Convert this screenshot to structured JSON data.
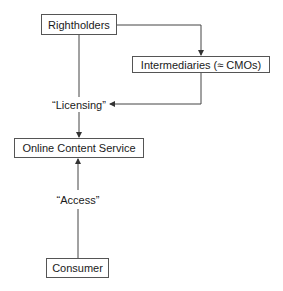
{
  "diagram": {
    "nodes": {
      "rightholders": "Rightholders",
      "intermediaries": "Intermediaries (≈ CMOs)",
      "online_content_service": "Online Content Service",
      "consumer": "Consumer"
    },
    "edge_labels": {
      "licensing": "“Licensing”",
      "access": "“Access”"
    },
    "edges": [
      {
        "from": "Rightholders",
        "to": "Intermediaries (≈ CMOs)"
      },
      {
        "from": "Intermediaries (≈ CMOs)",
        "to": "“Licensing”"
      },
      {
        "from": "Rightholders",
        "to": "Online Content Service",
        "via": "“Licensing”"
      },
      {
        "from": "Consumer",
        "to": "Online Content Service",
        "via": "“Access”"
      }
    ],
    "colors": {
      "line": "#444444",
      "box_border": "#555555",
      "text": "#1a1a1a"
    }
  }
}
